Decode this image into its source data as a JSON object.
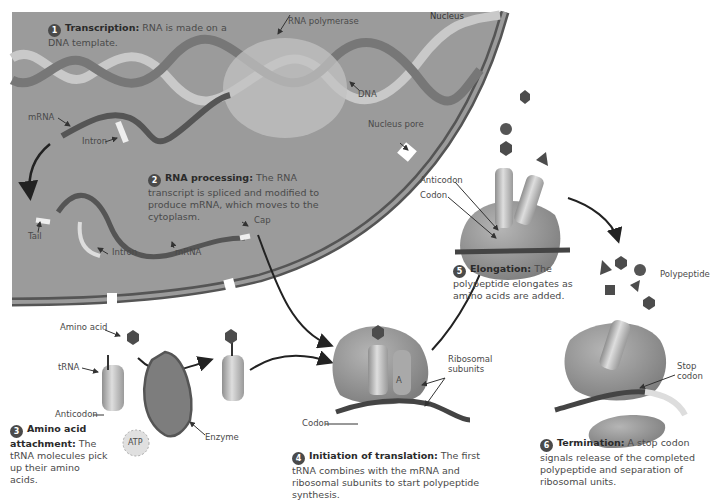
{
  "figure": {
    "regions": {
      "nucleus_label": "Nucleus",
      "nucleus_pore_label": "Nucleus pore"
    },
    "colors": {
      "nucleus_fill": "#9a9a9a",
      "nucleus_border": "#555555",
      "ribosome_fill": "#8c8c8c",
      "strand_dark": "#4e4e4e",
      "strand_light": "#dcdcdc",
      "amino_acid": "#505050",
      "background": "#ffffff"
    },
    "steps": [
      {
        "number": "1",
        "title": "Transcription:",
        "text": "RNA is made on a DNA template."
      },
      {
        "number": "2",
        "title": "RNA processing:",
        "text": "The RNA transcript is spliced and modified to produce mRNA, which moves to the cytoplasm."
      },
      {
        "number": "3",
        "title": "Amino acid attachment:",
        "text": "The tRNA molecules pick up their amino acids."
      },
      {
        "number": "4",
        "title": "Initiation of translation:",
        "text": "The first tRNA combines with the mRNA and ribosomal subunits to start polypeptide synthesis."
      },
      {
        "number": "5",
        "title": "Elongation:",
        "text": "The polypeptide elongates as amino acids are added."
      },
      {
        "number": "6",
        "title": "Termination:",
        "text": "A stop codon signals release of the completed polypeptide and separation of ribosomal units."
      }
    ],
    "labels": {
      "rna_polymerase": "RNA polymerase",
      "dna": "DNA",
      "mrna_top": "mRNA",
      "intron_top": "Intron",
      "tail": "Tail",
      "cap": "Cap",
      "intron_bottom": "Intron",
      "mrna_bottom": "mRNA",
      "amino_acid": "Amino acid",
      "trna": "tRNA",
      "anticodon_step3": "Anticodon",
      "atp": "ATP",
      "enzyme": "Enzyme",
      "codon_step4": "Codon",
      "a_site": "A",
      "ribosomal_subunits": "Ribosomal subunits",
      "anticodon_step5": "Anticodon",
      "codon_step5": "Codon",
      "polypeptide": "Polypeptide",
      "stop_codon": "Stop codon"
    }
  }
}
